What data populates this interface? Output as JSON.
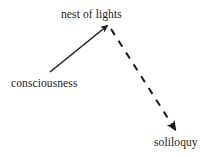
{
  "diagram": {
    "background_color": "#ffffff",
    "stroke_color": "#1b1b1b",
    "text_color": "#1b1b1b",
    "nodes": [
      {
        "id": "nest",
        "label": "nest of lights"
      },
      {
        "id": "consciousness",
        "label": "consciousness"
      },
      {
        "id": "soliloquy",
        "label": "soliloquy"
      }
    ],
    "edges": [
      {
        "id": "consciousness-to-nest",
        "from": "consciousness",
        "to": "nest",
        "style": "solid",
        "arrowhead": "filled-triangle"
      },
      {
        "id": "nest-to-soliloquy",
        "from": "nest",
        "to": "soliloquy",
        "style": "dashed",
        "arrowhead": "filled-triangle"
      }
    ]
  }
}
